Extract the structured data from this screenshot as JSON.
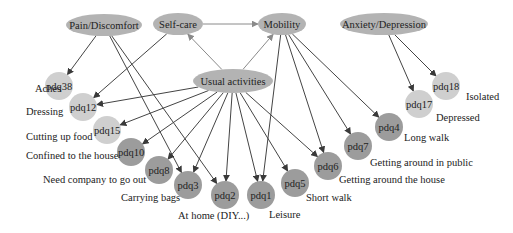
{
  "colors": {
    "dimension_fill": "#b3b3b3",
    "light_item_fill": "#cfcfcf",
    "dark_item_fill": "#9c9c9c",
    "edge": "#444444",
    "edge_light": "#8a8a8a",
    "text": "#222222"
  },
  "dimensions": [
    {
      "id": "pain",
      "label": "Pain/Discomfort",
      "cx": 104,
      "cy": 25,
      "rx": 38,
      "ry": 11
    },
    {
      "id": "selfcare",
      "label": "Self-care",
      "cx": 178,
      "cy": 24,
      "rx": 25,
      "ry": 11
    },
    {
      "id": "mobility",
      "label": "Mobility",
      "cx": 282,
      "cy": 24,
      "rx": 24,
      "ry": 11
    },
    {
      "id": "anxiety",
      "label": "Anxiety/Depression",
      "cx": 384,
      "cy": 24,
      "rx": 44,
      "ry": 11
    },
    {
      "id": "usual",
      "label": "Usual activities",
      "cx": 233,
      "cy": 81,
      "rx": 40,
      "ry": 12
    }
  ],
  "items": [
    {
      "id": "pdq38",
      "label": "pdq38",
      "desc": "Aches",
      "cx": 59,
      "cy": 86,
      "shade": "light",
      "dx": 35,
      "dy": 92
    },
    {
      "id": "pdq12",
      "label": "pdq12",
      "desc": "Dressing",
      "cx": 83,
      "cy": 107,
      "shade": "light",
      "dx": 26,
      "dy": 115
    },
    {
      "id": "pdq15",
      "label": "pdq15",
      "desc": "Cutting up food",
      "cx": 107,
      "cy": 130,
      "shade": "light",
      "dx": 26,
      "dy": 140
    },
    {
      "id": "pdq10",
      "label": "pdq10",
      "desc": "Confined to the house",
      "cx": 131,
      "cy": 152,
      "shade": "dark",
      "dx": 26,
      "dy": 159
    },
    {
      "id": "pdq8",
      "label": "pdq8",
      "desc": "Need company to go out",
      "cx": 159,
      "cy": 170,
      "shade": "dark",
      "dx": 43,
      "dy": 183
    },
    {
      "id": "pdq3",
      "label": "pdq3",
      "desc": "Carrying bags",
      "cx": 188,
      "cy": 185,
      "shade": "dark",
      "dx": 121,
      "dy": 201
    },
    {
      "id": "pdq2",
      "label": "pdq2",
      "desc": "At home (DIY...)",
      "cx": 225,
      "cy": 195,
      "shade": "dark",
      "dx": 178,
      "dy": 219
    },
    {
      "id": "pdq1",
      "label": "pdq1",
      "desc": "Leisure",
      "cx": 261,
      "cy": 195,
      "shade": "dark",
      "dx": 269,
      "dy": 218
    },
    {
      "id": "pdq5",
      "label": "pdq5",
      "desc": "Short walk",
      "cx": 295,
      "cy": 183,
      "shade": "dark",
      "dx": 306,
      "dy": 201
    },
    {
      "id": "pdq6",
      "label": "pdq6",
      "desc": "Getting around the house",
      "cx": 328,
      "cy": 166,
      "shade": "dark",
      "dx": 339,
      "dy": 183
    },
    {
      "id": "pdq7",
      "label": "pdq7",
      "desc": "Getting around in public",
      "cx": 358,
      "cy": 146,
      "shade": "dark",
      "dx": 370,
      "dy": 166
    },
    {
      "id": "pdq4",
      "label": "pdq4",
      "desc": "Long walk",
      "cx": 389,
      "cy": 127,
      "shade": "dark",
      "dx": 404,
      "dy": 141
    },
    {
      "id": "pdq17",
      "label": "pdq17",
      "desc": "Depressed",
      "cx": 419,
      "cy": 104,
      "shade": "light",
      "dx": 436,
      "dy": 121
    },
    {
      "id": "pdq18",
      "label": "pdq18",
      "desc": "Isolated",
      "cx": 446,
      "cy": 86,
      "shade": "light",
      "dx": 466,
      "dy": 100
    }
  ],
  "edges": [
    {
      "from": "selfcare",
      "to": "mobility",
      "style": "light"
    },
    {
      "from": "usual",
      "to": "selfcare",
      "style": "light"
    },
    {
      "from": "usual",
      "to": "mobility",
      "style": "light"
    },
    {
      "from": "pain",
      "to": "pdq38"
    },
    {
      "from": "pain",
      "to": "pdq3"
    },
    {
      "from": "pain",
      "to": "pdq2"
    },
    {
      "from": "selfcare",
      "to": "pdq12"
    },
    {
      "from": "anxiety",
      "to": "pdq17"
    },
    {
      "from": "anxiety",
      "to": "pdq18"
    },
    {
      "from": "usual",
      "to": "pdq12"
    },
    {
      "from": "usual",
      "to": "pdq15"
    },
    {
      "from": "usual",
      "to": "pdq10"
    },
    {
      "from": "usual",
      "to": "pdq8"
    },
    {
      "from": "usual",
      "to": "pdq3"
    },
    {
      "from": "usual",
      "to": "pdq2"
    },
    {
      "from": "usual",
      "to": "pdq1"
    },
    {
      "from": "usual",
      "to": "pdq5"
    },
    {
      "from": "usual",
      "to": "pdq6"
    },
    {
      "from": "mobility",
      "to": "pdq1"
    },
    {
      "from": "mobility",
      "to": "pdq6"
    },
    {
      "from": "mobility",
      "to": "pdq7"
    },
    {
      "from": "mobility",
      "to": "pdq4"
    }
  ]
}
